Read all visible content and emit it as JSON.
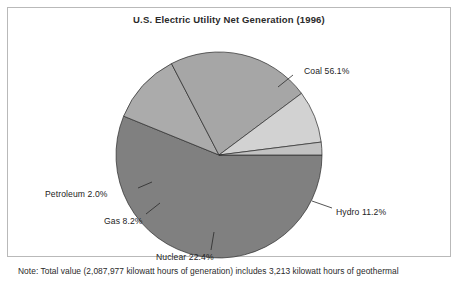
{
  "figure": {
    "title": "U.S. Electric Utility Net Generation (1996)",
    "footnote": "Note: Total value (2,087,977 kilowatt hours of generation) includes 3,213 kilowatt hours of geothermal",
    "frame_color": "#b9b9b9",
    "background": "#ffffff"
  },
  "labels": {
    "coal": "Coal 56.1%",
    "hydro": "Hydro 11.2%",
    "nuclear": "Nuclear 22.4%",
    "gas": "Gas 8.2%",
    "petroleum": "Petroleum 2.0%"
  },
  "chart_data": {
    "type": "pie",
    "title": "U.S. Electric Utility Net Generation (1996)",
    "xlabel": "",
    "ylabel": "",
    "units": "percent of net generation",
    "start_angle_deg": 0,
    "direction": "clockwise",
    "legend": "none",
    "grid": false,
    "data_labels": true,
    "categories": [
      "Coal",
      "Hydro",
      "Nuclear",
      "Gas",
      "Petroleum"
    ],
    "values": [
      56.1,
      11.2,
      22.4,
      8.2,
      2.0
    ],
    "colors": [
      "#808080",
      "#ababab",
      "#a6a6a6",
      "#d2d2d2",
      "#c2c2c2"
    ],
    "slices": [
      {
        "name": "Coal",
        "value": 56.1,
        "label": "Coal 56.1%",
        "color": "#808080"
      },
      {
        "name": "Hydro",
        "value": 11.2,
        "label": "Hydro 11.2%",
        "color": "#ababab"
      },
      {
        "name": "Nuclear",
        "value": 22.4,
        "label": "Nuclear 22.4%",
        "color": "#a6a6a6"
      },
      {
        "name": "Gas",
        "value": 8.2,
        "label": "Gas 8.2%",
        "color": "#d2d2d2"
      },
      {
        "name": "Petroleum",
        "value": 2.0,
        "label": "Petroleum 2.0%",
        "color": "#c2c2c2"
      }
    ],
    "annotations": [
      "Note: Total value (2,087,977 kilowatt hours of generation) includes 3,213 kilowatt hours of geothermal"
    ],
    "total_generation_kwh": "2,087,977",
    "geothermal_kwh": "3,213"
  }
}
